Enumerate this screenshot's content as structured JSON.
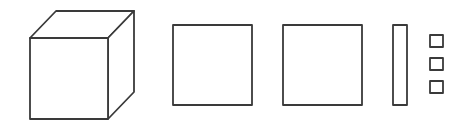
{
  "diagram": {
    "stroke_color": "#3a3a3a",
    "background": "#ffffff",
    "shapes": [
      {
        "id": "cube",
        "type": "cube-3d"
      },
      {
        "id": "square-1",
        "type": "square"
      },
      {
        "id": "square-2",
        "type": "square"
      },
      {
        "id": "thin-rect",
        "type": "rectangle"
      },
      {
        "id": "small-square-1",
        "type": "small-square"
      },
      {
        "id": "small-square-2",
        "type": "small-square"
      },
      {
        "id": "small-square-3",
        "type": "small-square"
      }
    ]
  }
}
